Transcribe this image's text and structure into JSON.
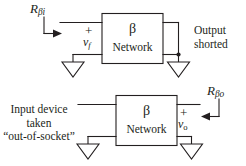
{
  "figure": {
    "title_text": "Beta network two-port diagrams",
    "stroke_color": "#231f20",
    "background_color": "#ffffff"
  },
  "top_circuit": {
    "resistance_label": {
      "symbol": "R",
      "subscript": "βi",
      "full": "Rβi"
    },
    "box": {
      "line1": "β",
      "line2": "Network"
    },
    "port_signs": {
      "plus": "+",
      "minus": "–"
    },
    "voltage_label": {
      "symbol": "v",
      "subscript": "f",
      "full": "vf"
    },
    "note": {
      "line1": "Output",
      "line2": "shorted"
    }
  },
  "bottom_circuit": {
    "resistance_label": {
      "symbol": "R",
      "subscript": "βo",
      "full": "Rβo"
    },
    "box": {
      "line1": "β",
      "line2": "Network"
    },
    "port_signs": {
      "plus": "+",
      "minus": "–"
    },
    "voltage_label": {
      "symbol": "v",
      "subscript": "o",
      "full": "vo"
    },
    "note": {
      "line1": "Input device",
      "line2": "taken",
      "line3": "“out-of-socket”"
    }
  }
}
